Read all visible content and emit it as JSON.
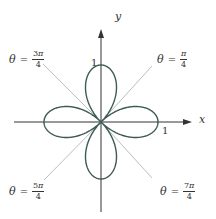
{
  "figure": {
    "curve": "r = cos 2θ",
    "colors": {
      "curve": "#3d5a55",
      "axes": "#333333",
      "diagonals": "#bdbdbd",
      "text": "#333333"
    },
    "axes": {
      "x_label": "x",
      "y_label": "y",
      "x_tick": "1",
      "y_tick": "1"
    },
    "theta_labels": [
      {
        "id": "pi-4",
        "theta": "θ",
        "eq": "=",
        "num_coef": "",
        "num_sym": "π",
        "den": "4"
      },
      {
        "id": "3pi-4",
        "theta": "θ",
        "eq": "=",
        "num_coef": "3",
        "num_sym": "π",
        "den": "4"
      },
      {
        "id": "5pi-4",
        "theta": "θ",
        "eq": "=",
        "num_coef": "5",
        "num_sym": "π",
        "den": "4"
      },
      {
        "id": "7pi-4",
        "theta": "θ",
        "eq": "=",
        "num_coef": "7",
        "num_sym": "π",
        "den": "4"
      }
    ]
  },
  "chart_data": {
    "type": "line",
    "title": "",
    "equation": "r = cos(2θ)",
    "coordinate_system": "polar",
    "xlabel": "x",
    "ylabel": "y",
    "tick_labels": {
      "x": [
        "1"
      ],
      "y": [
        "1"
      ]
    },
    "petal_tips": [
      [
        1,
        0
      ],
      [
        0,
        1
      ],
      [
        -1,
        0
      ],
      [
        0,
        -1
      ]
    ],
    "reference_lines": [
      "θ = π/4",
      "θ = 3π/4",
      "θ = 5π/4",
      "θ = 7π/4"
    ],
    "xlim": [
      -1.0,
      1.6
    ],
    "ylim": [
      -1.6,
      1.6
    ],
    "grid": false,
    "legend": "none"
  }
}
